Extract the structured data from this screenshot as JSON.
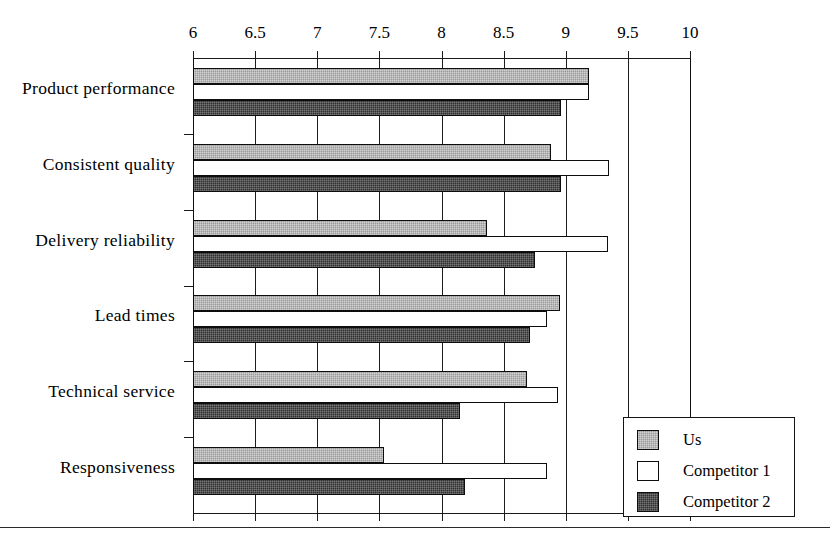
{
  "chart_data": {
    "type": "bar",
    "orientation": "horizontal",
    "title": "",
    "xlabel": "",
    "ylabel": "",
    "xlim": [
      6,
      10
    ],
    "xticks": [
      6,
      6.5,
      7,
      7.5,
      8,
      8.5,
      9,
      9.5,
      10
    ],
    "xtick_labels": [
      "6",
      "6.5",
      "7",
      "7.5",
      "8",
      "8.5",
      "9",
      "9.5",
      "10"
    ],
    "grid": "vertical",
    "legend_position": "bottom-right",
    "categories": [
      "Product performance",
      "Consistent quality",
      "Delivery reliability",
      "Lead times",
      "Technical service",
      "Responsiveness"
    ],
    "series": [
      {
        "name": "Us",
        "color": "#9b9b9b",
        "values": [
          9.19,
          8.88,
          8.37,
          8.95,
          8.69,
          7.54
        ]
      },
      {
        "name": "Competitor 1",
        "color": "#ffffff",
        "values": [
          9.19,
          9.35,
          9.34,
          8.85,
          8.94,
          8.85
        ]
      },
      {
        "name": "Competitor 2",
        "color": "#303030",
        "values": [
          8.96,
          8.96,
          8.75,
          8.71,
          8.15,
          8.19
        ]
      }
    ]
  },
  "legend": {
    "items": [
      {
        "label": "Us",
        "swatch": "us"
      },
      {
        "label": "Competitor 1",
        "swatch": "c1"
      },
      {
        "label": "Competitor 2",
        "swatch": "c2"
      }
    ]
  }
}
